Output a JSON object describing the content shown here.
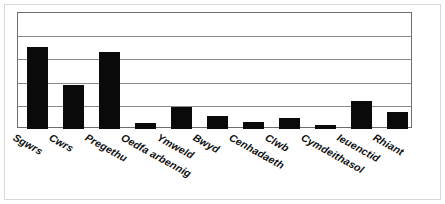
{
  "chart_data": {
    "type": "bar",
    "title": "",
    "subtitle": "",
    "xlabel": "",
    "ylabel": "",
    "categories": [
      "Sgwrs",
      "Cwrs",
      "Pregethu",
      "Oedfa arbennig",
      "Ymweld",
      "Bwyd",
      "Cenhadaeth",
      "Clwb",
      "Cymdeithasol",
      "Ieuenctid",
      "Rhiant"
    ],
    "values": [
      3.55,
      1.9,
      3.3,
      0.26,
      0.96,
      0.57,
      0.3,
      0.48,
      0.17,
      1.22,
      0.74
    ],
    "ylim": [
      0,
      5
    ],
    "yticks": [
      0,
      1,
      2,
      3,
      4,
      5
    ],
    "ytick_labels": [
      "",
      "",
      "",
      "",
      "",
      ""
    ],
    "grid": true,
    "grid_axis": "y",
    "legend": false,
    "legend_position": "none",
    "bar_color": "#0a0a0a",
    "grid_color": "#8a8a8a",
    "frame_color": "#6e6e6e",
    "background_color": "#ffffff",
    "annotations": []
  },
  "figure": {
    "border_color": "#d9d9d9"
  }
}
